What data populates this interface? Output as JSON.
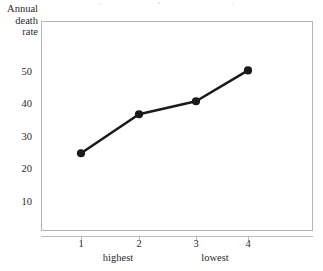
{
  "chart_data": {
    "type": "line",
    "title": "",
    "xlabel": "",
    "ylabel": "Annual death rate",
    "ylabel_lines": [
      "Annual",
      "death",
      "rate"
    ],
    "categories": [
      "1",
      "2",
      "3",
      "4"
    ],
    "x": [
      1,
      2,
      3,
      4
    ],
    "values": [
      25,
      37,
      41,
      50.5
    ],
    "series": [
      {
        "name": "Annual death rate",
        "values": [
          25,
          37,
          41,
          50.5
        ]
      }
    ],
    "yticks": [
      10,
      20,
      30,
      40,
      50
    ],
    "ytick_labels": [
      "10",
      "20",
      "30",
      "40",
      "50"
    ],
    "xtick_labels": [
      "1",
      "2",
      "3",
      "4"
    ],
    "group_labels": [
      {
        "text": "highest",
        "at": 1.65
      },
      {
        "text": "lowest",
        "at": 3.0
      }
    ],
    "ylim": [
      0,
      62
    ],
    "xlim": [
      0.3,
      4.7
    ],
    "grid": false,
    "legend": false,
    "legend_position": "none",
    "marker": "filled-circle",
    "line_color": "#1a1a1a",
    "marker_color": "#1a1a1a",
    "frame_color": "#b4b4b6",
    "background": "#ffffff"
  }
}
